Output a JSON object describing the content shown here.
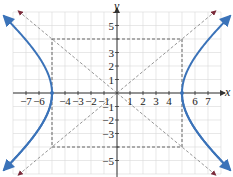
{
  "chart_data": {
    "type": "line",
    "title": "",
    "xlabel": "x",
    "ylabel": "y",
    "xlim": [
      -8,
      8
    ],
    "ylim": [
      -6,
      6
    ],
    "grid": true,
    "x_tick_labels": [
      "-7",
      "-6",
      "-4",
      "-3",
      "-2",
      "-1",
      "1",
      "2",
      "3",
      "4",
      "6",
      "7"
    ],
    "y_tick_labels": [
      "5",
      "3",
      "2",
      "1",
      "-1",
      "-2",
      "-3",
      "-5"
    ],
    "series": [
      {
        "name": "hyperbola",
        "equation": "x^2/25 - y^2/16 = 1",
        "color": "#3b73b9",
        "style": "solid",
        "vertices": [
          [
            -5,
            0
          ],
          [
            5,
            0
          ]
        ]
      },
      {
        "name": "asymptote-positive",
        "equation": "y = 4/5 x",
        "color": "#8a8a8a",
        "style": "dashed"
      },
      {
        "name": "asymptote-negative",
        "equation": "y = -4/5 x",
        "color": "#8a8a8a",
        "style": "dashed"
      },
      {
        "name": "central-rectangle",
        "corners": [
          [
            -5,
            4
          ],
          [
            5,
            4
          ],
          [
            5,
            -4
          ],
          [
            -5,
            -4
          ]
        ],
        "color": "#555555",
        "style": "dashed"
      }
    ]
  },
  "colors": {
    "curve": "#3b73b9",
    "asymptote": "#8a8a8a",
    "asymptote_arrow": "#7a2a3a",
    "grid": "#d9d9d9",
    "axis": "#333333",
    "rect": "#555555"
  },
  "labels": {
    "x_axis": "x",
    "y_axis": "y"
  }
}
